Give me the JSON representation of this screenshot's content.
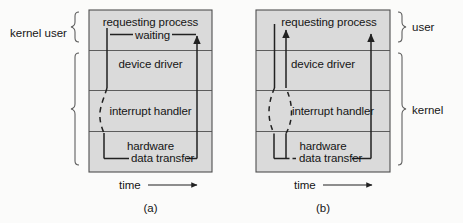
{
  "figure": {
    "background_color": "#fbfbfa",
    "panel_fill_color": "#d9d9d9",
    "line_color": "#1a1a1a"
  },
  "bands": [
    {
      "id": "requesting-process",
      "label": "requesting process"
    },
    {
      "id": "device-driver",
      "label": "device driver"
    },
    {
      "id": "interrupt-handler",
      "label": "interrupt handler"
    },
    {
      "id": "hardware",
      "label": "hardware"
    }
  ],
  "panels": [
    {
      "id": "panel-a",
      "caption": "(a)",
      "axis_label": "time",
      "bands": [
        {
          "label": "requesting process"
        },
        {
          "label": "device driver"
        },
        {
          "label": "interrupt handler"
        },
        {
          "label": "hardware"
        }
      ],
      "inline_labels": [
        {
          "id": "waiting",
          "text": "waiting"
        },
        {
          "id": "data-transfer",
          "text": "data transfer"
        }
      ],
      "side_braces": [
        {
          "id": "user-brace",
          "label": "user",
          "spans": [
            "requesting process"
          ]
        },
        {
          "id": "kernel-brace",
          "label": "kernel",
          "spans": [
            "device driver",
            "interrupt handler",
            "hardware"
          ]
        }
      ],
      "side_label_text": "kernel user",
      "side_label_position": "left"
    },
    {
      "id": "panel-b",
      "caption": "(b)",
      "axis_label": "time",
      "bands": [
        {
          "label": "requesting process"
        },
        {
          "label": "device driver"
        },
        {
          "label": "interrupt handler"
        },
        {
          "label": "hardware"
        }
      ],
      "inline_labels": [
        {
          "id": "data-transfer",
          "text": "data transfer"
        }
      ],
      "side_braces": [
        {
          "id": "user-brace",
          "label": "user",
          "spans": [
            "requesting process"
          ]
        },
        {
          "id": "kernel-brace",
          "label": "kernel",
          "spans": [
            "device driver",
            "interrupt handler",
            "hardware"
          ]
        }
      ],
      "side_label_position": "right"
    }
  ],
  "labels": {
    "kernel_user": "kernel user",
    "user": "user",
    "kernel": "kernel",
    "time": "time",
    "caption_a": "(a)",
    "caption_b": "(b)",
    "requesting_process": "requesting process",
    "device_driver": "device driver",
    "interrupt_handler": "interrupt handler",
    "hardware": "hardware",
    "waiting": "waiting",
    "data_transfer": "data transfer"
  }
}
